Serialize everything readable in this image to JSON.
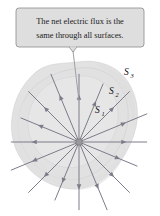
{
  "figure": {
    "callout": {
      "line1": "The net electric flux is the",
      "line2": "same through all surfaces.",
      "box_fill": "#dedede",
      "box_border": "#8a8a8a",
      "text_color": "#1a1a1a"
    },
    "labels": [
      {
        "id": "S1",
        "base": "S",
        "sub": "1",
        "x": 96,
        "y": 113
      },
      {
        "id": "S2",
        "base": "S",
        "sub": "2",
        "x": 110,
        "y": 94
      },
      {
        "id": "S3",
        "base": "S",
        "sub": "3",
        "x": 125,
        "y": 75
      }
    ],
    "charge": {
      "name": "point-charge",
      "x": 79,
      "y": 142,
      "size": 5,
      "fill": "#9a9a9a",
      "stroke": "#6e6e6e"
    },
    "field_lines": {
      "count": 16,
      "color": "#7c7c8a",
      "width": 1.0,
      "arrow_direction": "outward",
      "angles_deg": [
        0,
        22.5,
        45,
        67.5,
        90,
        112.5,
        135,
        157.5,
        180,
        202.5,
        225,
        247.5,
        270,
        292.5,
        315,
        337.5
      ],
      "length": 74
    },
    "surfaces": [
      {
        "id": "S1",
        "fill": "#e6e6e6",
        "stroke": "#d2d2d2",
        "opacity": 0.85
      },
      {
        "id": "S2",
        "fill": "#e2e2e2",
        "stroke": "#cfcfcf",
        "opacity": 0.8
      },
      {
        "id": "S3",
        "fill": "#dcdcdc",
        "stroke": "#c8c8c8",
        "opacity": 0.75
      }
    ],
    "leader": {
      "color": "#9a9a9a",
      "from_x": 73,
      "from_y": 51,
      "to_x": 79,
      "to_y": 100
    },
    "background": "#ffffff"
  }
}
